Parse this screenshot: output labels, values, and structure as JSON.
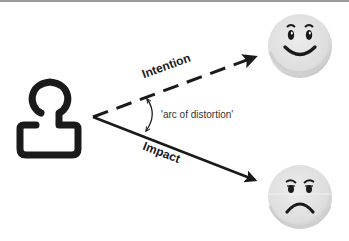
{
  "diagram": {
    "labels": {
      "intention": "Intention",
      "impact": "Impact",
      "arc": "'arc of distortion'"
    },
    "nodes": {
      "person": {
        "icon": "person-outline-icon"
      },
      "happy_face": {
        "icon": "happy-face-icon"
      },
      "sad_face": {
        "icon": "sad-face-icon"
      }
    },
    "edges": [
      {
        "from": "person",
        "to": "happy_face",
        "label": "Intention",
        "style": "dashed"
      },
      {
        "from": "person",
        "to": "sad_face",
        "label": "Impact",
        "style": "solid"
      }
    ],
    "colors": {
      "stroke": "#1a1a1a",
      "face_fill": "#e2e2e2",
      "face_shade": "#cfcfcf",
      "top_rule": "#9a9a9a"
    }
  }
}
